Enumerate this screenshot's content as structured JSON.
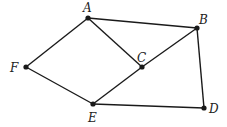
{
  "diagram": {
    "type": "graph",
    "nodes": [
      {
        "id": "A",
        "label": "A",
        "x": 88,
        "y": 18,
        "lx": 83,
        "ly": 12
      },
      {
        "id": "B",
        "label": "B",
        "x": 197,
        "y": 28,
        "lx": 199,
        "ly": 24
      },
      {
        "id": "C",
        "label": "C",
        "x": 142,
        "y": 67,
        "lx": 137,
        "ly": 62
      },
      {
        "id": "D",
        "label": "D",
        "x": 204,
        "y": 108,
        "lx": 209,
        "ly": 113
      },
      {
        "id": "E",
        "label": "E",
        "x": 93,
        "y": 104,
        "lx": 88,
        "ly": 122
      },
      {
        "id": "F",
        "label": "F",
        "x": 26,
        "y": 67,
        "lx": 10,
        "ly": 72
      }
    ],
    "edges": [
      {
        "from": "A",
        "to": "B"
      },
      {
        "from": "A",
        "to": "C"
      },
      {
        "from": "A",
        "to": "F"
      },
      {
        "from": "B",
        "to": "C"
      },
      {
        "from": "B",
        "to": "D"
      },
      {
        "from": "C",
        "to": "E"
      },
      {
        "from": "F",
        "to": "E"
      },
      {
        "from": "E",
        "to": "D"
      }
    ],
    "colors": {
      "line": "#1a1a1a",
      "node": "#1a1a1a",
      "label": "#222222"
    }
  }
}
